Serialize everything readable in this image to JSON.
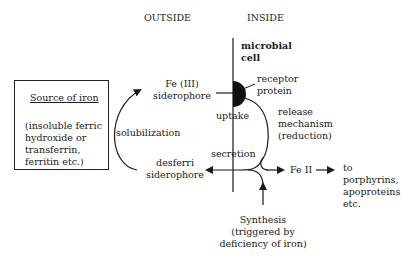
{
  "diagram": {
    "headers": {
      "outside": "OUTSIDE",
      "inside": "INSIDE"
    },
    "cell_label": {
      "line1": "microbial",
      "line2": "cell"
    },
    "source_box": {
      "title": "Source of iron",
      "lines": [
        "(insoluble ferric",
        "hydroxide or",
        "transferrin,",
        "ferritin etc.)"
      ]
    },
    "nodes": {
      "fe3_siderophore": [
        "Fe (III)",
        "siderophore"
      ],
      "desferri_siderophore": [
        "desferri",
        "siderophore"
      ],
      "receptor_protein": [
        "receptor",
        "protein"
      ],
      "fe2": "Fe II",
      "destination": [
        "to",
        "porphyrins,",
        "apoproteins",
        "etc."
      ],
      "synthesis": [
        "Synthesis",
        "(triggered by",
        "deficiency of iron)"
      ]
    },
    "processes": {
      "solubilization": "solubilization",
      "uptake": "uptake",
      "release": [
        "release",
        "mechanism",
        "(reduction)"
      ],
      "secretion": "secretion"
    },
    "colors": {
      "line": "#1a1a1a",
      "background": "#ffffff"
    }
  }
}
